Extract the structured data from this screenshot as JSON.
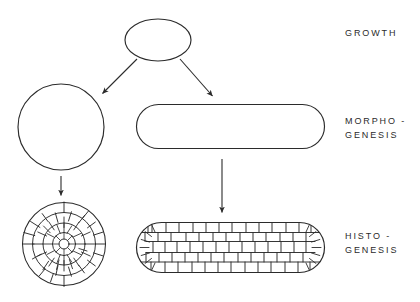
{
  "figure": {
    "background_color": "#ffffff",
    "stroke_color": "#2b2b2b"
  },
  "labels": {
    "growth": {
      "line1": "GROWTH",
      "line2": ""
    },
    "morphogenesis": {
      "line1": "MORPHO -",
      "line2": "GENESIS"
    },
    "histogenesis": {
      "line1": "HISTO -",
      "line2": "GENESIS"
    }
  },
  "shapes": {
    "top_ellipse": {
      "name": "ellipse",
      "cx": 158,
      "cy": 40,
      "rx": 33,
      "ry": 21
    },
    "left_circle": {
      "name": "circle",
      "cx": 61,
      "cy": 127,
      "r": 43
    },
    "right_rounded_rect": {
      "name": "rounded-rectangle",
      "x": 136,
      "y": 104,
      "width": 189,
      "height": 45,
      "radius": 22
    },
    "left_cell_circle": {
      "name": "cellular-circle",
      "cx": 64,
      "cy": 244,
      "r": 42,
      "rings": 4
    },
    "right_cell_rect": {
      "name": "cellular-rounded-rectangle",
      "x": 136,
      "y": 222,
      "width": 189,
      "height": 51,
      "radius": 25
    }
  },
  "arrows": {
    "growth_to_left": {
      "x1": 137,
      "y1": 59,
      "x2": 101,
      "y2": 95
    },
    "growth_to_right": {
      "x1": 180,
      "y1": 59,
      "x2": 214,
      "y2": 98
    },
    "circle_down": {
      "x1": 61,
      "y1": 176,
      "x2": 61,
      "y2": 198
    },
    "rect_down": {
      "x1": 222,
      "y1": 159,
      "x2": 222,
      "y2": 215
    }
  }
}
